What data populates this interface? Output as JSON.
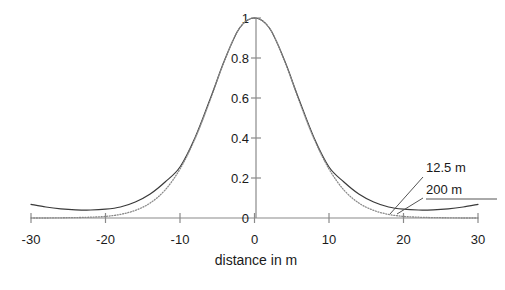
{
  "chart_data": {
    "type": "line",
    "title": "",
    "subtitle": "",
    "xlabel": "distance in m",
    "ylabel": "",
    "xlim": [
      -30,
      30
    ],
    "ylim": [
      0,
      1
    ],
    "grid": false,
    "legend_position": "inline-annotation-right",
    "xticks": [
      -30,
      -20,
      -10,
      0,
      10,
      20,
      30
    ],
    "xticklabels": [
      "-30",
      "-20",
      "-10",
      "0",
      "10",
      "20",
      "30"
    ],
    "yticks": [
      0,
      0.2,
      0.4,
      0.6,
      0.8,
      1
    ],
    "yticklabels": [
      "0",
      "0.2",
      "0.4",
      "0.6",
      "0.8",
      "1"
    ],
    "annotations": [
      {
        "text": "12.5 m",
        "series": "12.5 m",
        "points_to_x": 23.0,
        "points_to_y": 0.05
      },
      {
        "text": "200 m",
        "series": "200 m",
        "points_to_x": 24.5,
        "points_to_y": 0.03
      }
    ],
    "series": [
      {
        "name": "12.5 m",
        "style": "solid",
        "color": "#3a3a3a",
        "x": [
          -30,
          -28,
          -26,
          -24,
          -22,
          -20,
          -18,
          -16,
          -14,
          -12,
          -10,
          -8,
          -6,
          -4,
          -2,
          0,
          2,
          4,
          6,
          8,
          10,
          12,
          14,
          16,
          18,
          20,
          22,
          24,
          26,
          28,
          30
        ],
        "y": [
          0.068,
          0.055,
          0.046,
          0.041,
          0.04,
          0.044,
          0.055,
          0.08,
          0.12,
          0.18,
          0.255,
          0.4,
          0.59,
          0.79,
          0.95,
          1.0,
          0.95,
          0.79,
          0.59,
          0.4,
          0.255,
          0.18,
          0.12,
          0.08,
          0.055,
          0.044,
          0.04,
          0.041,
          0.046,
          0.055,
          0.068
        ]
      },
      {
        "name": "200 m",
        "style": "dotted",
        "color": "#8a8a8a",
        "x": [
          -30,
          -28,
          -26,
          -24,
          -22,
          -20,
          -18,
          -16,
          -14,
          -12,
          -10,
          -8,
          -6,
          -4,
          -2,
          0,
          2,
          4,
          6,
          8,
          10,
          12,
          14,
          16,
          18,
          20,
          22,
          24,
          26,
          28,
          30
        ],
        "y": [
          0.0,
          0.0,
          0.001,
          0.002,
          0.004,
          0.008,
          0.018,
          0.038,
          0.075,
          0.14,
          0.245,
          0.395,
          0.585,
          0.79,
          0.95,
          1.0,
          0.95,
          0.79,
          0.585,
          0.395,
          0.245,
          0.14,
          0.075,
          0.038,
          0.018,
          0.008,
          0.004,
          0.002,
          0.001,
          0.0,
          0.0
        ]
      }
    ]
  },
  "colors": {
    "background": "#ffffff",
    "axis": "#8a8a8a",
    "text": "#1a1a1a",
    "series_solid": "#3a3a3a",
    "series_dotted": "#8a8a8a",
    "leader_line": "#555555"
  }
}
